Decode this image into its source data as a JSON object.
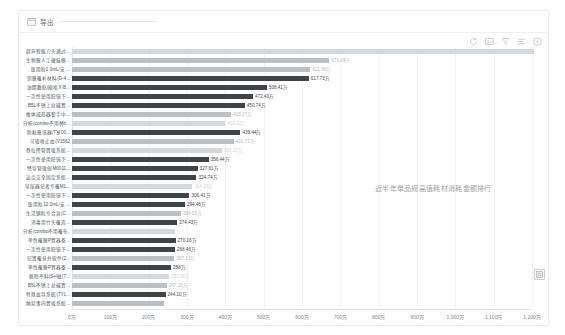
{
  "header": {
    "icon": "calendar-icon",
    "title": "导出",
    "rule": ""
  },
  "toolbar": {
    "items": [
      {
        "name": "refresh-icon",
        "label": "刷新"
      },
      {
        "name": "image-save-icon",
        "label": "保存为图片"
      },
      {
        "name": "filter-icon",
        "label": "筛选"
      },
      {
        "name": "data-view-icon",
        "label": "数据视图"
      },
      {
        "name": "download-icon",
        "label": "下载"
      }
    ]
  },
  "annotation": {
    "text": "近半年单品规高值耗材消耗金额排行"
  },
  "float_button": {
    "name": "fullscreen-icon",
    "label": "全屏"
  },
  "chart_data": {
    "type": "bar",
    "orientation": "horizontal",
    "title": "近半年单品规高值耗材消耗金额排行",
    "xlabel": "",
    "ylabel": "",
    "unit": "万",
    "xlim": [
      0,
      1200
    ],
    "grid": true,
    "legend": "none",
    "xticks": [
      "0万",
      "100万",
      "200万",
      "300万",
      "400万",
      "500万",
      "600万",
      "700万",
      "800万",
      "900万",
      "1,000万",
      "1,100万",
      "1,200万"
    ],
    "xtick_values": [
      0,
      100,
      200,
      300,
      400,
      500,
      600,
      700,
      800,
      900,
      1000,
      1100,
      1200
    ],
    "categories": [
      "超声智能刀头通过...",
      "生物膜人工硬脑膜...",
      "医用粒2.0mL/支 ...",
      "钽膜覆补材料(D-4...",
      "油脂敷贴(规格X-B...",
      "一次性使用腔镜下...",
      "B5L不锈上总碱置...",
      "椎体成形器套手中...",
      "分析(combo不用替b...",
      "防粘膜或器(T室00...",
      "可吸收止血(V1562",
      "骨位所管置吸系统...",
      "一次性使用腔镜下...",
      "经导管微创M0011...",
      "远点交全固定系统...",
      "导尿器记者专覆M1...",
      "一次性使用腔镜下...",
      "医用粒12.0mL/支 ...",
      "生活钢粒专合治(C...",
      "消毒用竹头覆造...",
      "分析(combo不用覆布...",
      "单性覆膜P置器备...",
      "一次性使用腔镜下...",
      "记置覆身并软件(2...",
      "单性覆膜P置器备...",
      "脱除不料(S+/磁(7...",
      "B5L不锈上总碱置...",
      "特殊血导系统(7Y1...",
      "纳尼事内置吸系统..."
    ],
    "values": [
      1205.0,
      671.14,
      621.96,
      617.73,
      508.41,
      472.43,
      450.74,
      415.27,
      400.22,
      439.44,
      421.71,
      390.15,
      356.44,
      327.61,
      324.74,
      314.16,
      306.41,
      294.46,
      284.03,
      274.43,
      268.9,
      270.16,
      268.46,
      267.13,
      258.0,
      253.66,
      247.2,
      244.1,
      240.55
    ],
    "value_labels": [
      "",
      "671.14万",
      "621.96万",
      "617.73万",
      "508.41万",
      "472.43万",
      "450.74万",
      "415.27万",
      "400.22万",
      "439.44万",
      "421.71万",
      "390.15万",
      "356.44万",
      "327.61万",
      "324.74万",
      "314.16万",
      "306.41万",
      "294.46万",
      "284.03万",
      "274.43万",
      "",
      "270.16万",
      "268.46万",
      "267.13万",
      "258万",
      "253.66万",
      "247.20万",
      "244.10万",
      ""
    ],
    "emphasis": [
      "dimmer",
      "dim",
      "dim",
      "normal",
      "normal",
      "normal",
      "normal",
      "dim",
      "dimmer",
      "normal",
      "dim",
      "dimmer",
      "normal",
      "normal",
      "normal",
      "dimmer",
      "normal",
      "normal",
      "dim",
      "normal",
      "dimmer",
      "normal",
      "normal",
      "dim",
      "normal",
      "dimmer",
      "dim",
      "normal",
      "dim"
    ]
  }
}
